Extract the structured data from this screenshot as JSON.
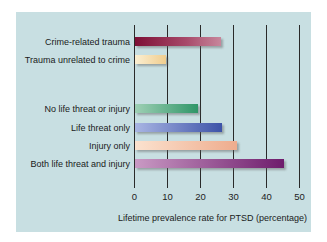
{
  "chart_data": {
    "type": "bar",
    "orientation": "horizontal",
    "title": "",
    "xlabel": "Lifetime prevalence rate for PTSD (percentage)",
    "ylabel": "",
    "xlim": [
      0,
      50
    ],
    "xticks": [
      "0",
      "10",
      "20",
      "30",
      "40",
      "50"
    ],
    "grid": true,
    "legend": null,
    "groups": [
      {
        "categories": [
          "Crime-related trauma",
          "Trauma unrelated to crime"
        ],
        "values": [
          26,
          9.5
        ]
      },
      {
        "categories": [
          "No life threat or injury",
          "Life threat only",
          "Injury only",
          "Both life threat and injury"
        ],
        "values": [
          19,
          26.5,
          31,
          45
        ]
      }
    ],
    "categories": [
      "Crime-related trauma",
      "Trauma unrelated to crime",
      "No life threat or injury",
      "Life threat only",
      "Injury only",
      "Both life threat and injury"
    ],
    "values": [
      26,
      9.5,
      19,
      26.5,
      31,
      45
    ],
    "colors": [
      "#8a1a3e",
      "#f3d9a6",
      "#3e9a72",
      "#4a5fae",
      "#f0b79a",
      "#7a2c78"
    ]
  },
  "bars": [
    {
      "label": "Crime-related trauma",
      "value": 26,
      "top": 37,
      "grad": "linear-gradient(to right, #7d0f35, #a84a6a 60%, #c7879c)"
    },
    {
      "label": "Trauma unrelated to crime",
      "value": 9.5,
      "top": 55,
      "grad": "linear-gradient(to right, #fbefd2, #f0cd8e)"
    },
    {
      "label": "No life threat or injury",
      "value": 19,
      "top": 104,
      "grad": "linear-gradient(to right, #9fd0b5, #2f9668)"
    },
    {
      "label": "Life threat only",
      "value": 26.5,
      "top": 123,
      "grad": "linear-gradient(to right, #a9b5e3, #3d53a8)"
    },
    {
      "label": "Injury only",
      "value": 31,
      "top": 141,
      "grad": "linear-gradient(to right, #fbe2cf, #eeac8d)"
    },
    {
      "label": "Both life threat and injury",
      "value": 45,
      "top": 159,
      "grad": "linear-gradient(to right, #c99ac4, #6e1c6c)"
    }
  ],
  "axis": {
    "ticks": [
      "0",
      "10",
      "20",
      "30",
      "40",
      "50"
    ],
    "title": "Lifetime prevalence rate for PTSD (percentage)"
  }
}
